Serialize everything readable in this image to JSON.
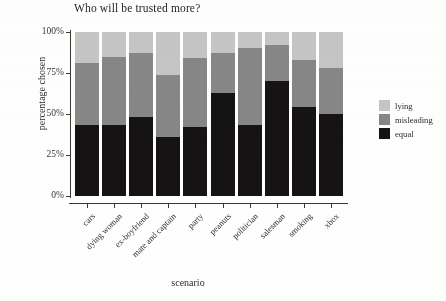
{
  "chart_data": {
    "type": "bar",
    "subtype": "stacked-100-percent",
    "title": "Who will be trusted more?",
    "xlabel": "scenario",
    "ylabel": "percentage chosen",
    "ylim": [
      0,
      100
    ],
    "yticks": [
      0,
      25,
      50,
      75,
      100
    ],
    "ytick_labels": [
      "0%",
      "25%",
      "50%",
      "75%",
      "100%"
    ],
    "grid": false,
    "legend_position": "right",
    "categories": [
      "cars",
      "dying woman",
      "ex-boyfriend",
      "mate and captain",
      "party",
      "peanuts",
      "politician",
      "salesman",
      "smoking",
      "xbox"
    ],
    "series": [
      {
        "name": "equal",
        "color": "#151313",
        "values": [
          43,
          43,
          48,
          36,
          42,
          63,
          43,
          70,
          54,
          50
        ]
      },
      {
        "name": "misleading",
        "color": "#878787",
        "values": [
          38,
          42,
          39,
          38,
          42,
          24,
          47,
          22,
          29,
          28
        ]
      },
      {
        "name": "lying",
        "color": "#c6c6c6",
        "values": [
          19,
          15,
          13,
          26,
          16,
          13,
          10,
          8,
          17,
          22
        ]
      }
    ],
    "stack_order_bottom_to_top": [
      "equal",
      "misleading",
      "lying"
    ],
    "legend_order_top_to_bottom": [
      "lying",
      "misleading",
      "equal"
    ]
  },
  "colors": {
    "lying": "#c6c6c6",
    "misleading": "#878787",
    "equal": "#151313",
    "axis": "#3b3735",
    "text": "#2f2b2a",
    "background": "#ffffff"
  }
}
